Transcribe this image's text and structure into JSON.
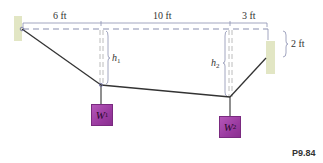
{
  "diagram": {
    "problem_label": "P9.84",
    "dimensions": {
      "span_1": "6 ft",
      "span_2": "10 ft",
      "span_3": "3 ft",
      "right_offset": "2 ft"
    },
    "heights": {
      "h1": {
        "symbol": "h",
        "subscript": "1"
      },
      "h2": {
        "symbol": "h",
        "subscript": "2"
      }
    },
    "weights": {
      "w1": {
        "symbol": "W",
        "subscript": "1"
      },
      "w2": {
        "symbol": "W",
        "subscript": "2"
      }
    },
    "colors": {
      "cable": "#333333",
      "dashed_reference": "#8a8fb0",
      "wall": "#e4e8c8",
      "weight_box": "#a545a8"
    }
  }
}
